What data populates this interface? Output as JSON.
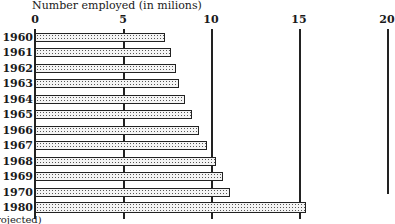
{
  "chart_data": {
    "type": "bar",
    "orientation": "horizontal",
    "title": "Number employed (in milions)",
    "xlabel": "Number employed (in milions)",
    "ylabel": "",
    "xlim": [
      0,
      20
    ],
    "x_ticks": [
      "0",
      "5",
      "10",
      "15",
      "20"
    ],
    "grid": true,
    "categories": [
      "1960",
      "1961",
      "1962",
      "1963",
      "1964",
      "1965",
      "1966",
      "1967",
      "1968",
      "1969",
      "1970",
      "1980"
    ],
    "values": [
      7.4,
      7.7,
      8.0,
      8.2,
      8.5,
      8.9,
      9.3,
      9.8,
      10.3,
      10.7,
      11.1,
      15.4
    ],
    "footnote": "(projected)",
    "fill_pattern": "dotted"
  },
  "title": "Number employed (in milions)",
  "footnote": "rojected)"
}
